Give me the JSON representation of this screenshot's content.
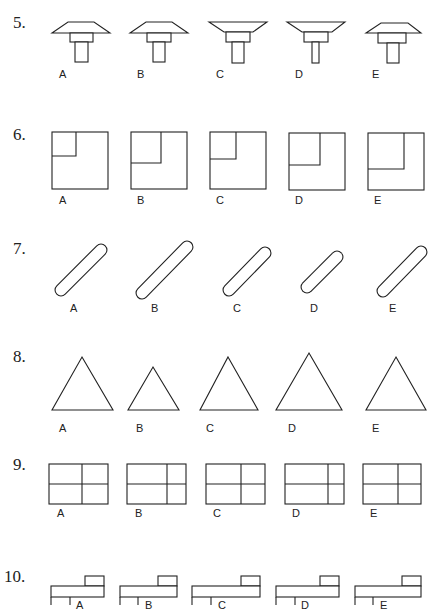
{
  "questions": [
    {
      "number": "5.",
      "type": "t-shaped-fixtures",
      "options": [
        "A",
        "B",
        "C",
        "D",
        "E"
      ]
    },
    {
      "number": "6.",
      "type": "squares-with-inset",
      "options": [
        "A",
        "B",
        "C",
        "D",
        "E"
      ]
    },
    {
      "number": "7.",
      "type": "diagonal-capsules",
      "options": [
        "A",
        "B",
        "C",
        "D",
        "E"
      ]
    },
    {
      "number": "8.",
      "type": "triangles",
      "options": [
        "A",
        "B",
        "C",
        "D",
        "E"
      ]
    },
    {
      "number": "9.",
      "type": "divided-rectangles",
      "options": [
        "A",
        "B",
        "C",
        "D",
        "E"
      ]
    },
    {
      "number": "10.",
      "type": "stepped-blocks",
      "options": [
        "A",
        "B",
        "C",
        "D",
        "E"
      ]
    }
  ],
  "colors": {
    "stroke": "#222222",
    "background": "#ffffff"
  }
}
